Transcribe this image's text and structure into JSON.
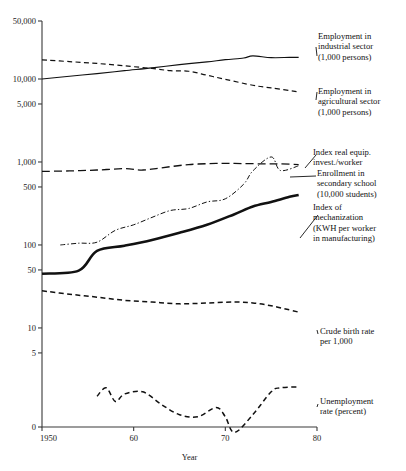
{
  "chart_data": {
    "type": "line",
    "title": "",
    "xlabel": "Year",
    "ylabel": "",
    "scale": "log",
    "grid": false,
    "legend_position": "right-inline-annotations",
    "xlim": [
      1950,
      1980
    ],
    "ylim": [
      0,
      50000
    ],
    "x_ticks": [
      "1950",
      "60",
      "70",
      "80"
    ],
    "x_tick_values": [
      1950,
      1960,
      1970,
      1980
    ],
    "y_ticks": [
      "50,000",
      "10,000",
      "5,000",
      "1,000",
      "500",
      "100",
      "50",
      "10",
      "5",
      "0"
    ],
    "y_tick_values": [
      50000,
      10000,
      5000,
      1000,
      500,
      100,
      50,
      10,
      5,
      0
    ],
    "series": [
      {
        "name": "Employment in industrial sector (1,000 persons)",
        "style": "solid",
        "width": 1.1,
        "label": "Employment in\nindustrial sector\n(1,000 persons)",
        "x": [
          1950,
          1953,
          1956,
          1959,
          1962,
          1965,
          1968,
          1970,
          1972,
          1973,
          1975,
          1977,
          1978
        ],
        "values": [
          10000,
          10800,
          11600,
          12600,
          13600,
          14900,
          16100,
          17100,
          17900,
          19000,
          18100,
          18200,
          18200
        ]
      },
      {
        "name": "Employment in agricultural sector (1,000 persons)",
        "style": "dashed",
        "width": 1.2,
        "label": "Employment in\nagricultural sector\n(1,000 persons)",
        "x": [
          1950,
          1953,
          1956,
          1959,
          1962,
          1964,
          1966,
          1968,
          1970,
          1973,
          1975,
          1978
        ],
        "values": [
          17000,
          16200,
          15400,
          14400,
          13400,
          12600,
          12400,
          11100,
          9900,
          8400,
          7800,
          7000
        ]
      },
      {
        "name": "Enrollment in secondary school (10,000 students)",
        "style": "longdash",
        "width": 1.3,
        "label": "Enrollment in\nsecondary school\n(10,000 students)",
        "x": [
          1950,
          1953,
          1956,
          1959,
          1961,
          1963,
          1966,
          1969,
          1971,
          1974,
          1976,
          1978
        ],
        "values": [
          770,
          780,
          800,
          830,
          800,
          850,
          930,
          960,
          960,
          950,
          950,
          930
        ]
      },
      {
        "name": "Index real equip. invest./worker",
        "style": "dashdot",
        "width": 1.0,
        "label": "Index real equip.\ninvest./worker",
        "x": [
          1952,
          1954,
          1956,
          1958,
          1960,
          1962,
          1964,
          1966,
          1968,
          1970,
          1972,
          1973,
          1975,
          1976,
          1978
        ],
        "values": [
          100,
          105,
          108,
          150,
          175,
          215,
          260,
          275,
          330,
          360,
          540,
          780,
          1150,
          790,
          900
        ]
      },
      {
        "name": "Index of mechanization (KWH per worker in manufacturing)",
        "style": "bold",
        "width": 2.6,
        "label": "Index of\nmechanization\n(KWH per worker\nin manufacturing)",
        "x": [
          1950,
          1954,
          1956,
          1959,
          1962,
          1965,
          1968,
          1971,
          1973,
          1975,
          1977,
          1978
        ],
        "values": [
          45,
          49,
          85,
          98,
          115,
          140,
          175,
          235,
          290,
          330,
          380,
          400
        ]
      },
      {
        "name": "Crude birth rate per 1,000",
        "style": "dashed",
        "width": 1.5,
        "label": "Crude birth rate\nper 1,000",
        "x": [
          1950,
          1953,
          1956,
          1959,
          1962,
          1965,
          1968,
          1971,
          1973,
          1975,
          1977,
          1978
        ],
        "values": [
          28,
          25.5,
          23.5,
          21.5,
          20.5,
          19.5,
          20,
          20.5,
          20,
          18.5,
          16.5,
          15.5
        ]
      },
      {
        "name": "Unemployment rate (percent)",
        "style": "dashed",
        "width": 1.5,
        "label": "Unemployment\nrate (percent)",
        "x": [
          1956,
          1957,
          1958,
          1959,
          1961,
          1963,
          1965,
          1967,
          1969,
          1970,
          1971,
          1973,
          1975,
          1976,
          1978
        ],
        "values": [
          1.5,
          1.9,
          1.3,
          1.6,
          1.7,
          1.2,
          0.9,
          0.85,
          1.1,
          0.85,
          0.55,
          0.9,
          1.7,
          1.9,
          1.95
        ]
      }
    ],
    "annotations": [
      {
        "key": "industrial",
        "text": "Employment in\nindustrial sector\n(1,000 persons)"
      },
      {
        "key": "agricultural",
        "text": "Employment in\nagricultural sector\n(1,000 persons)"
      },
      {
        "key": "equip",
        "text": "Index real equip.\ninvest./worker"
      },
      {
        "key": "enrollment",
        "text": "Enrollment in\nsecondary school\n(10,000 students)"
      },
      {
        "key": "mechanization",
        "text": "Index of\nmechanization\n(KWH per worker\nin manufacturing)"
      },
      {
        "key": "birthrate",
        "text": "Crude birth rate\nper 1,000"
      },
      {
        "key": "unemployment",
        "text": "Unemployment\nrate (percent)"
      }
    ]
  }
}
